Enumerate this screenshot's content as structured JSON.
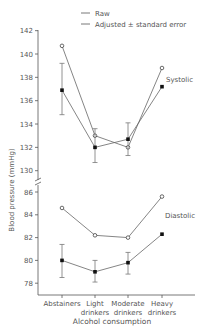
{
  "legend": {
    "raw_label": "Raw",
    "adjusted_label": "Adjusted ± standard error"
  },
  "axes": {
    "ylabel": "Blood pressure (mmHg)",
    "xlabel": "Alcohol consumption",
    "systolic_ticks": [
      "142",
      "140",
      "138",
      "136",
      "134",
      "132",
      "130"
    ],
    "diastolic_ticks": [
      "86",
      "84",
      "82",
      "80",
      "78"
    ],
    "categories": [
      [
        "Abstainers",
        ""
      ],
      [
        "Light",
        "drinkers"
      ],
      [
        "Moderate",
        "drinkers"
      ],
      [
        "Heavy",
        "drinkers"
      ]
    ]
  },
  "labels": {
    "systolic": "Systolic",
    "diastolic": "Diastolic"
  },
  "chart_data": {
    "type": "line",
    "title": "",
    "xlabel": "Alcohol consumption",
    "ylabel": "Blood pressure (mmHg)",
    "categories": [
      "Abstainers",
      "Light drinkers",
      "Moderate drinkers",
      "Heavy drinkers"
    ],
    "y_axis_break": true,
    "ylim_upper": [
      130,
      142
    ],
    "ylim_lower": [
      77.5,
      86.5
    ],
    "grid": false,
    "legend_position": "top",
    "series": [
      {
        "name": "Systolic - Raw",
        "marker": "open-circle",
        "values": [
          140.7,
          133.0,
          132.0,
          138.8
        ]
      },
      {
        "name": "Systolic - Adjusted",
        "marker": "filled-square",
        "values": [
          136.9,
          132.0,
          132.7,
          137.2
        ],
        "error_low": [
          134.8,
          130.7,
          131.3,
          null
        ],
        "error_high": [
          139.2,
          133.6,
          134.1,
          null
        ]
      },
      {
        "name": "Diastolic - Raw",
        "marker": "open-circle",
        "values": [
          84.6,
          82.2,
          82.0,
          85.6
        ]
      },
      {
        "name": "Diastolic - Adjusted",
        "marker": "filled-square",
        "values": [
          80.0,
          79.0,
          79.8,
          82.3
        ],
        "error_low": [
          78.5,
          78.1,
          78.8,
          null
        ],
        "error_high": [
          81.4,
          80.0,
          80.7,
          null
        ]
      }
    ],
    "annotations": [
      "Systolic",
      "Diastolic"
    ]
  }
}
